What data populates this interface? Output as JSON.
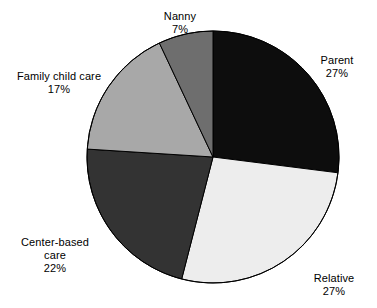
{
  "chart_data": {
    "type": "pie",
    "title": "",
    "subtitle": "",
    "xlabel": "",
    "ylabel": "",
    "legend_position": "none",
    "grid": false,
    "labels_outside": true,
    "start_angle_deg": 0,
    "direction": "clockwise",
    "categories": [
      "Parent",
      "Relative",
      "Center-based care",
      "Family child care",
      "Nanny"
    ],
    "values": [
      27,
      27,
      22,
      17,
      7
    ],
    "value_unit": "%",
    "slices": [
      {
        "name": "Parent",
        "label": "Parent",
        "value": 27,
        "value_label": "27%",
        "color": "#0d0d0d",
        "start_deg": 0,
        "end_deg": 97.2
      },
      {
        "name": "Relative",
        "label": "Relative",
        "value": 27,
        "value_label": "27%",
        "color": "#ededed",
        "start_deg": 97.2,
        "end_deg": 194.4
      },
      {
        "name": "Center-based care",
        "label": "Center-based",
        "label_line2": "care",
        "value": 22,
        "value_label": "22%",
        "color": "#333333",
        "start_deg": 194.4,
        "end_deg": 273.6
      },
      {
        "name": "Family child care",
        "label": "Family child care",
        "value": 17,
        "value_label": "17%",
        "color": "#a8a8a8",
        "start_deg": 273.6,
        "end_deg": 334.8
      },
      {
        "name": "Nanny",
        "label": "Nanny",
        "value": 7,
        "value_label": "7%",
        "color": "#6e6e6e",
        "start_deg": 334.8,
        "end_deg": 360
      }
    ],
    "outline_color": "#000000",
    "background_color": "#ffffff",
    "text_color": "#000000",
    "center_x": 213,
    "center_y": 157,
    "radius": 126
  }
}
